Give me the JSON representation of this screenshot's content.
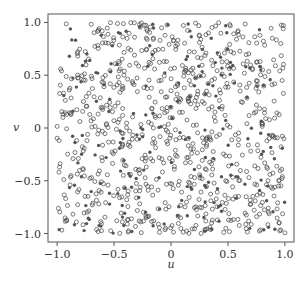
{
  "chart_data": {
    "type": "scatter",
    "title": "",
    "xlabel": "u",
    "ylabel": "v",
    "xlim": [
      -1.08,
      1.08
    ],
    "ylim": [
      -1.08,
      1.08
    ],
    "xticks": [
      -1.0,
      -0.5,
      0,
      0.5,
      1.0
    ],
    "xtick_labels": [
      "−1.0",
      "−0.5",
      "0",
      "0.5",
      "1.0"
    ],
    "yticks": [
      -1.0,
      -0.5,
      0,
      0.5,
      1.0
    ],
    "ytick_labels": [
      "−1.0",
      "−0.5",
      "0",
      "0.5",
      "1.0"
    ],
    "grid": false,
    "legend": null,
    "approx_point_count": 1000,
    "series": [
      {
        "name": "hollow",
        "marker": "open-circle",
        "color": "#444444",
        "count_approx": 800,
        "generator": {
          "seed": 12345,
          "n": 800
        }
      },
      {
        "name": "filled",
        "marker": "filled-circle",
        "color": "#555555",
        "count_approx": 200,
        "generator": {
          "seed": 67890,
          "n": 200
        }
      }
    ]
  },
  "colors": {
    "frame": "#555555",
    "marker_edge": "#444444",
    "marker_fill": "#555555",
    "text": "#333333"
  }
}
